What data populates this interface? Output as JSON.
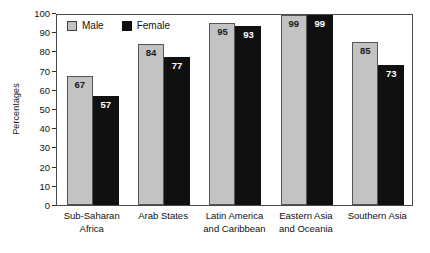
{
  "chart_data": {
    "type": "bar",
    "title": "",
    "xlabel": "",
    "ylabel": "Percentages",
    "ylim": [
      0,
      100
    ],
    "ytick_step": 10,
    "yticks": [
      100,
      90,
      80,
      70,
      60,
      50,
      40,
      30,
      20,
      10,
      0
    ],
    "grid": false,
    "legend_position": "top-left-inside",
    "categories": [
      "Sub-Saharan Africa",
      "Arab States",
      "Latin America and Caribbean",
      "Eastern Asia and Oceania",
      "Southern Asia"
    ],
    "category_label_lines": [
      [
        "Sub-Saharan",
        "Africa"
      ],
      [
        "Arab States"
      ],
      [
        "Latin America",
        "and Caribbean"
      ],
      [
        "Eastern Asia",
        "and Oceania"
      ],
      [
        "Southern Asia"
      ]
    ],
    "series": [
      {
        "name": "Male",
        "color": "#c3c3c3",
        "values": [
          67,
          84,
          95,
          99,
          85
        ]
      },
      {
        "name": "Female",
        "color": "#101010",
        "values": [
          57,
          77,
          93,
          99,
          73
        ]
      }
    ],
    "value_labels_inside_bars": true
  },
  "legend": {
    "items": [
      {
        "label": "Male",
        "swatch": "male-swatch"
      },
      {
        "label": "Female",
        "swatch": "female-swatch"
      }
    ]
  },
  "colors": {
    "male_fill": "#c3c3c3",
    "female_fill": "#101010",
    "axis": "#4a4a4a",
    "text": "#111111",
    "background": "#ffffff"
  }
}
